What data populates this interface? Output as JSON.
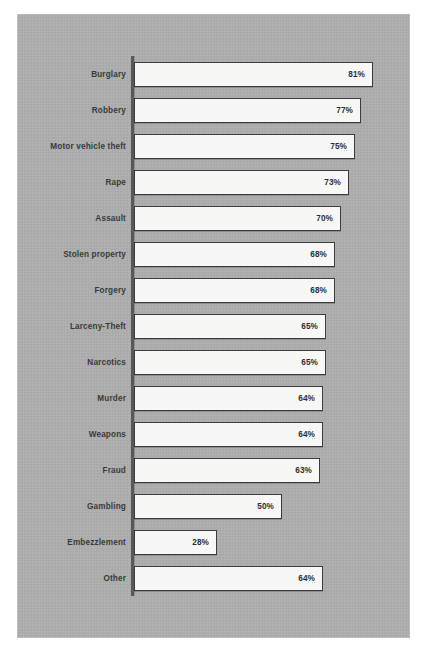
{
  "figure": {
    "background_color": "#ffffff",
    "panel_color": "#adadad",
    "bar_fill_color": "#f7f7f5",
    "bar_border_color": "#3c3c3e",
    "axis_color": "#58585a",
    "label_color": "#3a3a3c"
  },
  "chart_data": {
    "type": "bar",
    "orientation": "horizontal",
    "title": "",
    "subtitle": "",
    "xlabel": "",
    "ylabel": "",
    "xlim": [
      0,
      85
    ],
    "grid": false,
    "legend": false,
    "value_suffix": "%",
    "categories": [
      "Burglary",
      "Robbery",
      "Motor vehicle theft",
      "Rape",
      "Assault",
      "Stolen property",
      "Forgery",
      "Larceny-Theft",
      "Narcotics",
      "Murder",
      "Weapons",
      "Fraud",
      "Gambling",
      "Embezzlement",
      "Other"
    ],
    "values": [
      81,
      77,
      75,
      73,
      70,
      68,
      68,
      65,
      65,
      64,
      64,
      63,
      50,
      28,
      64
    ],
    "value_labels": [
      "81%",
      "77%",
      "75%",
      "73%",
      "70%",
      "68%",
      "68%",
      "65%",
      "65%",
      "64%",
      "64%",
      "63%",
      "50%",
      "28%",
      "64%"
    ]
  }
}
